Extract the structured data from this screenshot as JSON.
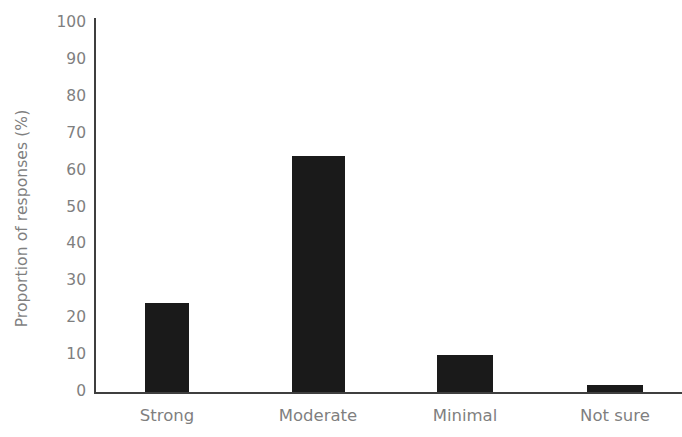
{
  "chart_data": {
    "type": "bar",
    "title": "",
    "subtitle": "",
    "xlabel": "",
    "ylabel": "Proportion of responses (%)",
    "categories": [
      "Strong",
      "Moderate",
      "Minimal",
      "Not sure"
    ],
    "values": [
      24,
      64,
      10,
      2
    ],
    "series": [
      {
        "name": "Proportion of responses",
        "values": [
          24,
          64,
          10,
          2
        ]
      }
    ],
    "ylim": [
      0,
      100
    ],
    "ytick_labels": [
      "100",
      "90",
      "80",
      "70",
      "60",
      "50",
      "40",
      "30",
      "20",
      "10",
      "0"
    ],
    "ytick_values": [
      100,
      90,
      80,
      70,
      60,
      50,
      40,
      30,
      20,
      10,
      0
    ],
    "grid": false,
    "legend": false,
    "legend_position": "none",
    "annotations": [],
    "colors": {
      "bar": "#1a1a1a",
      "axis": "#3f3f3f",
      "tick_label": "#7f7f7f",
      "axis_title": "#7f7f7f",
      "background": "#ffffff"
    }
  }
}
